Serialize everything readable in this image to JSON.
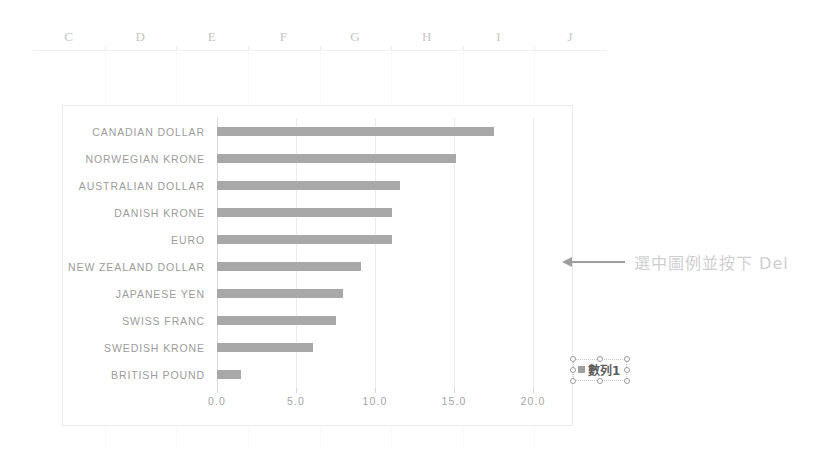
{
  "spreadsheet": {
    "column_headers": [
      "C",
      "D",
      "E",
      "F",
      "G",
      "H",
      "I",
      "J"
    ]
  },
  "legend": {
    "series_label": "數列1",
    "marker_color": "#a0a0a0",
    "selected": true,
    "handle_count": 8
  },
  "annotation": {
    "text": "選中圖例並按下 Del",
    "arrow": "arrow-left",
    "color": "#cfcfcf"
  },
  "chart_data": {
    "type": "bar",
    "orientation": "horizontal",
    "title": "",
    "xlabel": "",
    "ylabel": "",
    "categories": [
      "CANADIAN DOLLAR",
      "NORWEGIAN KRONE",
      "AUSTRALIAN DOLLAR",
      "DANISH KRONE",
      "EURO",
      "NEW ZEALAND DOLLAR",
      "JAPANESE YEN",
      "SWISS FRANC",
      "SWEDISH KRONE",
      "BRITISH POUND"
    ],
    "values": [
      17.5,
      15.1,
      11.6,
      11.1,
      11.1,
      9.1,
      8.0,
      7.5,
      6.1,
      1.5
    ],
    "series": [
      {
        "name": "數列1",
        "values": [
          17.5,
          15.1,
          11.6,
          11.1,
          11.1,
          9.1,
          8.0,
          7.5,
          6.1,
          1.5
        ]
      }
    ],
    "xlim": [
      0,
      20
    ],
    "xticks": [
      0,
      5,
      10,
      15,
      20
    ],
    "xtick_labels": [
      "0.0",
      "5.0",
      "10.0",
      "15.0",
      "20.0"
    ],
    "grid": true,
    "legend_position": "right",
    "bar_color": "#a8a8a8"
  }
}
